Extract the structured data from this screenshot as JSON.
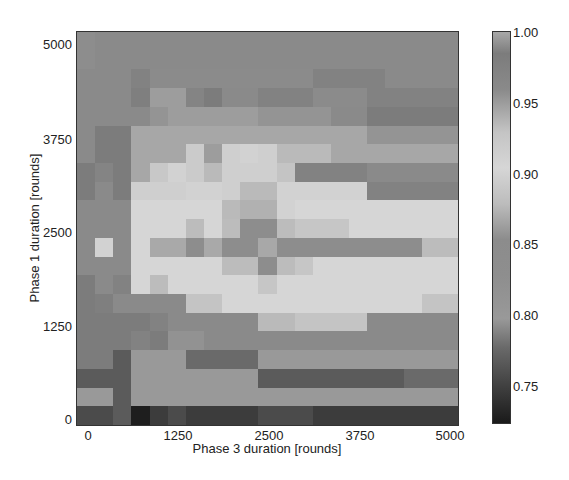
{
  "chart_data": {
    "type": "heatmap",
    "title": "",
    "xlabel": "Phase 3 duration [rounds]",
    "ylabel": "Phase 1 duration [rounds]",
    "x_ticks": [
      "0",
      "1250",
      "2500",
      "3750",
      "5000"
    ],
    "y_ticks": [
      "5000",
      "3750",
      "2500",
      "1250",
      "0"
    ],
    "x_range": [
      0,
      5000
    ],
    "y_range": [
      0,
      5000
    ],
    "grid_size": [
      21,
      21
    ],
    "step": 250,
    "colorbar": {
      "ticks": [
        "1.00",
        "0.95",
        "0.90",
        "0.85",
        "0.80",
        "0.75"
      ],
      "range": [
        0.727,
        1.0
      ],
      "colormap_gray_stops": [
        {
          "v": 1.0,
          "c": "#a8a8a8"
        },
        {
          "v": 0.985,
          "c": "#7c7c7c"
        },
        {
          "v": 0.96,
          "c": "#8a8a8a"
        },
        {
          "v": 0.93,
          "c": "#c4c4c4"
        },
        {
          "v": 0.905,
          "c": "#d6d6d6"
        },
        {
          "v": 0.88,
          "c": "#bcbcbc"
        },
        {
          "v": 0.855,
          "c": "#8c8c8c"
        },
        {
          "v": 0.83,
          "c": "#8e8e8e"
        },
        {
          "v": 0.8,
          "c": "#999999"
        },
        {
          "v": 0.78,
          "c": "#6a6a6a"
        },
        {
          "v": 0.75,
          "c": "#3c3c3c"
        },
        {
          "v": 0.727,
          "c": "#1a1a1a"
        }
      ]
    },
    "rows_top_to_bottom": [
      [
        0.84,
        0.96,
        0.96,
        0.96,
        0.96,
        0.96,
        0.96,
        0.96,
        0.96,
        0.96,
        0.96,
        0.96,
        0.96,
        0.96,
        0.96,
        0.96,
        0.96,
        0.96,
        0.96,
        0.96,
        0.96
      ],
      [
        0.84,
        0.96,
        0.96,
        0.96,
        0.96,
        0.96,
        0.96,
        0.96,
        0.96,
        0.96,
        0.96,
        0.96,
        0.96,
        0.96,
        0.96,
        0.96,
        0.96,
        0.96,
        0.96,
        0.96,
        0.96
      ],
      [
        0.96,
        0.96,
        0.96,
        0.975,
        0.99,
        0.99,
        0.99,
        0.99,
        0.99,
        0.99,
        0.99,
        0.99,
        0.99,
        0.975,
        0.975,
        0.975,
        0.975,
        0.96,
        0.96,
        0.96,
        0.96
      ],
      [
        0.96,
        0.96,
        0.96,
        0.98,
        0.95,
        0.95,
        0.97,
        0.985,
        0.96,
        0.96,
        0.975,
        0.975,
        0.975,
        0.99,
        0.99,
        0.99,
        0.975,
        0.975,
        0.975,
        0.975,
        0.975
      ],
      [
        0.96,
        0.96,
        0.96,
        0.96,
        0.955,
        0.95,
        0.95,
        0.95,
        0.95,
        0.95,
        0.955,
        0.955,
        0.955,
        0.955,
        0.96,
        0.96,
        0.985,
        0.985,
        0.985,
        0.985,
        0.985
      ],
      [
        0.96,
        0.985,
        0.985,
        0.945,
        0.945,
        0.945,
        0.945,
        0.945,
        0.945,
        0.945,
        0.945,
        0.945,
        0.945,
        0.945,
        0.945,
        0.945,
        0.955,
        0.955,
        0.955,
        0.955,
        0.955
      ],
      [
        0.96,
        0.985,
        0.985,
        0.945,
        0.945,
        0.945,
        0.92,
        0.95,
        0.915,
        0.91,
        0.915,
        0.935,
        0.935,
        0.935,
        0.945,
        0.945,
        0.945,
        0.945,
        0.945,
        0.945,
        0.945
      ],
      [
        0.985,
        0.97,
        0.985,
        0.945,
        0.925,
        0.91,
        0.92,
        0.935,
        0.915,
        0.915,
        0.915,
        0.93,
        0.975,
        0.975,
        0.975,
        0.975,
        0.96,
        0.96,
        0.96,
        0.96,
        0.96
      ],
      [
        0.985,
        0.96,
        0.985,
        0.915,
        0.915,
        0.915,
        0.91,
        0.91,
        0.915,
        0.935,
        0.935,
        0.91,
        0.91,
        0.91,
        0.91,
        0.91,
        0.975,
        0.975,
        0.975,
        0.975,
        0.975
      ],
      [
        0.96,
        0.96,
        0.96,
        0.905,
        0.905,
        0.905,
        0.905,
        0.905,
        0.935,
        0.94,
        0.94,
        0.91,
        0.905,
        0.905,
        0.905,
        0.905,
        0.905,
        0.905,
        0.905,
        0.905,
        0.905
      ],
      [
        0.96,
        0.96,
        0.96,
        0.905,
        0.905,
        0.905,
        0.88,
        0.905,
        0.88,
        0.845,
        0.845,
        0.88,
        0.89,
        0.89,
        0.89,
        0.905,
        0.905,
        0.905,
        0.905,
        0.905,
        0.905
      ],
      [
        0.96,
        0.91,
        0.96,
        0.905,
        0.87,
        0.87,
        0.845,
        0.87,
        0.845,
        0.845,
        1.0,
        0.845,
        0.845,
        0.845,
        0.845,
        0.845,
        0.845,
        0.845,
        0.845,
        0.88,
        0.88
      ],
      [
        0.96,
        0.96,
        0.96,
        0.905,
        0.905,
        0.905,
        0.905,
        0.905,
        0.88,
        0.88,
        0.845,
        0.88,
        0.89,
        0.905,
        0.905,
        0.905,
        0.905,
        0.905,
        0.905,
        0.905,
        0.905
      ],
      [
        0.985,
        0.96,
        0.975,
        0.905,
        0.88,
        0.905,
        0.905,
        0.905,
        0.905,
        0.905,
        0.89,
        0.905,
        0.905,
        0.905,
        0.905,
        0.905,
        0.905,
        0.905,
        0.905,
        0.905,
        0.905
      ],
      [
        0.985,
        0.98,
        0.96,
        0.96,
        0.96,
        0.96,
        0.93,
        0.93,
        0.905,
        0.905,
        0.905,
        0.905,
        0.905,
        0.905,
        0.905,
        0.905,
        0.905,
        0.905,
        0.905,
        0.93,
        0.93
      ],
      [
        0.985,
        0.985,
        0.985,
        0.985,
        0.975,
        0.96,
        0.96,
        0.96,
        0.96,
        0.96,
        0.935,
        0.935,
        0.93,
        0.93,
        0.93,
        0.93,
        0.96,
        0.96,
        0.96,
        0.96,
        0.96
      ],
      [
        0.985,
        0.985,
        0.985,
        0.975,
        0.985,
        0.82,
        0.82,
        0.96,
        0.96,
        0.96,
        0.96,
        0.96,
        0.96,
        0.96,
        0.96,
        0.96,
        0.96,
        0.96,
        0.96,
        0.96,
        0.96
      ],
      [
        0.985,
        0.985,
        0.77,
        0.8,
        0.8,
        0.8,
        0.78,
        0.78,
        0.78,
        0.78,
        0.8,
        0.8,
        0.8,
        0.8,
        0.8,
        0.8,
        0.8,
        0.8,
        0.8,
        0.8,
        0.8
      ],
      [
        0.77,
        0.77,
        0.77,
        0.8,
        0.8,
        0.8,
        0.8,
        0.8,
        0.8,
        0.8,
        0.77,
        0.77,
        0.77,
        0.77,
        0.77,
        0.77,
        0.77,
        0.77,
        0.78,
        0.78,
        0.78
      ],
      [
        0.8,
        0.8,
        0.77,
        0.8,
        0.8,
        0.8,
        0.8,
        0.8,
        0.8,
        0.8,
        0.8,
        0.8,
        0.8,
        0.8,
        0.8,
        0.8,
        0.8,
        0.8,
        0.8,
        0.8,
        0.8
      ],
      [
        0.76,
        0.76,
        0.77,
        0.73,
        0.75,
        0.76,
        0.75,
        0.75,
        0.75,
        0.75,
        0.76,
        0.76,
        0.76,
        0.75,
        0.75,
        0.75,
        0.75,
        0.75,
        0.75,
        0.75,
        0.75
      ]
    ]
  }
}
